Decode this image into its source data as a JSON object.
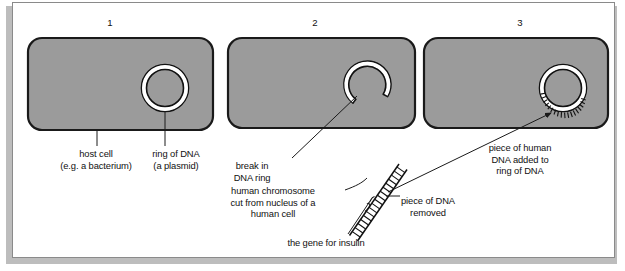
{
  "diagram": {
    "panels": [
      {
        "number": "1",
        "name": "host-cell-panel"
      },
      {
        "number": "2",
        "name": "cut-plasmid-panel"
      },
      {
        "number": "3",
        "name": "recombinant-plasmid-panel"
      }
    ],
    "labels": {
      "host_cell": "host cell\n(e.g. a bacterium)",
      "ring_of_dna": "ring of DNA\n(a plasmid)",
      "break_in_ring": "break in\nDNA ring",
      "human_chromosome": "human chromosome\ncut from nucleus of a\nhuman cell",
      "gene_for_insulin": "the gene for insulin",
      "piece_removed": "piece of DNA\nremoved",
      "piece_added": "piece of human\nDNA added to\nring of DNA"
    },
    "colors": {
      "cell_fill": "#9b9b9b",
      "cell_stroke": "#1a1a1a",
      "ring_stroke": "#111111",
      "ring_inner": "#ffffff",
      "page_background": "#ffffff",
      "frame_border": "#8a8a8a",
      "shadow": "#bdbdbd",
      "text": "#111111"
    },
    "shapes": {
      "cell1": {
        "name": "host-cell-1",
        "x": 28,
        "y": 38,
        "w": 185,
        "h": 92,
        "r": 14
      },
      "cell2": {
        "name": "host-cell-2",
        "x": 228,
        "y": 38,
        "w": 187,
        "h": 90,
        "r": 14
      },
      "cell3": {
        "name": "host-cell-3",
        "x": 424,
        "y": 38,
        "w": 184,
        "h": 90,
        "r": 14
      },
      "ring1": {
        "name": "plasmid-ring-intact",
        "cx": 165,
        "cy": 88,
        "r": 22
      },
      "ring2": {
        "name": "plasmid-ring-broken",
        "cx": 365,
        "cy": 83,
        "r": 22,
        "gap_start_deg": 120,
        "gap_end_deg": 168
      },
      "ring3": {
        "name": "plasmid-ring-recombinant",
        "cx": 563,
        "cy": 88,
        "r": 22,
        "insert_start_deg": 150,
        "insert_end_deg": 30
      },
      "chromosome": {
        "name": "human-chromosome-strand",
        "x1": 352,
        "y1": 238,
        "x2": 402,
        "y2": 166
      }
    }
  }
}
